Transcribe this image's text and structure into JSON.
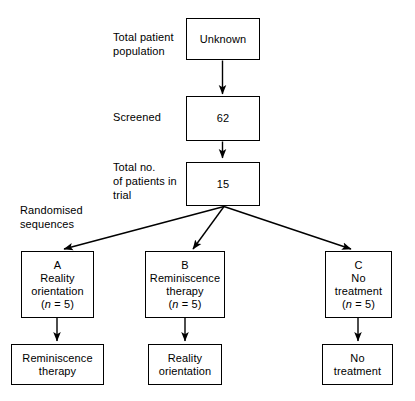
{
  "diagram": {
    "stroke_color": "#000000",
    "background_color": "#ffffff",
    "stage_labels": [
      {
        "id": "total-patient-population",
        "text": "Total patient\npopulation"
      },
      {
        "id": "screened",
        "text": "Screened"
      },
      {
        "id": "total-no-of-patients-in-trial",
        "text": "Total no.\nof patients in\ntrial"
      },
      {
        "id": "randomised-sequences",
        "text": "Randomised\nsequences"
      }
    ],
    "stage_boxes": [
      {
        "id": "box-unknown",
        "value": "Unknown"
      },
      {
        "id": "box-screened-count",
        "value": "62"
      },
      {
        "id": "box-trial-total",
        "value": "15"
      }
    ],
    "arm_boxes": [
      {
        "id": "arm-a",
        "letter": "A",
        "line1": "Reality",
        "line2": "orientation",
        "n_prefix": "(",
        "n_symbol": "n",
        "n_value": " = 5)"
      },
      {
        "id": "arm-b",
        "letter": "B",
        "line1": "Reminiscence",
        "line2": "therapy",
        "n_prefix": "(",
        "n_symbol": "n",
        "n_value": " = 5)"
      },
      {
        "id": "arm-c",
        "letter": "C",
        "line1": "No",
        "line2": "treatment",
        "n_prefix": "(",
        "n_symbol": "n",
        "n_value": " = 5)"
      }
    ],
    "crossover_boxes": [
      {
        "id": "crossover-a",
        "line1": "Reminiscence",
        "line2": "therapy"
      },
      {
        "id": "crossover-b",
        "line1": "Reality",
        "line2": "orientation"
      },
      {
        "id": "crossover-c",
        "line1": "No",
        "line2": "treatment"
      }
    ]
  }
}
